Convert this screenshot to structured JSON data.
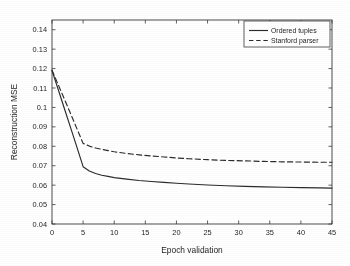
{
  "chart_data": {
    "type": "line",
    "title": "",
    "xlabel": "Epoch validation",
    "ylabel": "Reconstruction MSE",
    "xlim": [
      0,
      45
    ],
    "ylim": [
      0.04,
      0.145
    ],
    "xticks": [
      0,
      5,
      10,
      15,
      20,
      25,
      30,
      35,
      40,
      45
    ],
    "xticklabels": [
      "0",
      "5",
      "10",
      "15",
      "20",
      "25",
      "30",
      "35",
      "40",
      "45"
    ],
    "yticks": [
      0.04,
      0.05,
      0.06,
      0.07,
      0.08,
      0.09,
      0.1,
      0.11,
      0.12,
      0.13,
      0.14
    ],
    "yticklabels": [
      "0.04",
      "0.05",
      "0.06",
      "0.07",
      "0.08",
      "0.09",
      "0.1",
      "0.11",
      "0.12",
      "0.13",
      "0.14"
    ],
    "grid": false,
    "legend_position": "top-right",
    "series": [
      {
        "name": "Ordered tuples",
        "style": "solid",
        "color": "#2b2b2b",
        "x": [
          0,
          1,
          2,
          3,
          4,
          5,
          6,
          7,
          8,
          9,
          10,
          12,
          14,
          16,
          18,
          20,
          22,
          25,
          28,
          31,
          34,
          37,
          40,
          43,
          45
        ],
        "y": [
          0.119,
          0.1092,
          0.0993,
          0.0895,
          0.0796,
          0.0695,
          0.0673,
          0.066,
          0.0651,
          0.0645,
          0.0639,
          0.0631,
          0.0624,
          0.0619,
          0.0614,
          0.061,
          0.0606,
          0.0601,
          0.0597,
          0.0594,
          0.0591,
          0.0589,
          0.0587,
          0.0586,
          0.0585
        ]
      },
      {
        "name": "Stanford parser",
        "style": "dashed",
        "color": "#2b2b2b",
        "x": [
          0,
          1,
          2,
          3,
          4,
          5,
          6,
          7,
          8,
          9,
          10,
          12,
          14,
          16,
          18,
          20,
          22,
          25,
          28,
          31,
          34,
          37,
          40,
          43,
          45
        ],
        "y": [
          0.1192,
          0.1117,
          0.1042,
          0.0967,
          0.0891,
          0.0815,
          0.0801,
          0.0791,
          0.0784,
          0.0778,
          0.0772,
          0.0763,
          0.0756,
          0.075,
          0.0745,
          0.074,
          0.0736,
          0.0731,
          0.0727,
          0.0725,
          0.0722,
          0.072,
          0.0719,
          0.0718,
          0.0718
        ]
      }
    ]
  },
  "legend": {
    "entries": [
      {
        "label": "Ordered tuples"
      },
      {
        "label": "Stanford parser"
      }
    ]
  },
  "axes": {
    "x_title": "Epoch validation",
    "y_title": "Reconstruction MSE"
  }
}
